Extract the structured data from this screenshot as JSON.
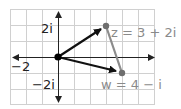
{
  "diagram": {
    "type": "complex-plane",
    "grid": {
      "x_min": -3,
      "x_max": 6,
      "y_min": -3,
      "y_max": 3,
      "spacing_px": 16,
      "color": "#d0d0d0"
    },
    "axes": {
      "color": "#222222"
    },
    "tick_labels": {
      "x_neg": "−2",
      "y_pos": "2i",
      "y_neg": "−2i"
    },
    "vectors": [
      {
        "name": "z",
        "from": [
          0,
          0
        ],
        "to": [
          3,
          2
        ],
        "color": "#111111"
      },
      {
        "name": "w",
        "from": [
          0,
          0
        ],
        "to": [
          4,
          -1
        ],
        "color": "#111111"
      }
    ],
    "segment": {
      "from": [
        3,
        2
      ],
      "to": [
        4,
        -1
      ],
      "color": "#8c8c8c"
    },
    "points": [
      {
        "name": "z",
        "value": [
          3,
          2
        ],
        "label": "z = 3 + 2i",
        "color": "#6e6e6e"
      },
      {
        "name": "w",
        "value": [
          4,
          -1
        ],
        "label": "w = 4 − i",
        "color": "#6e6e6e"
      }
    ],
    "origin_dot_color": "#000000"
  }
}
